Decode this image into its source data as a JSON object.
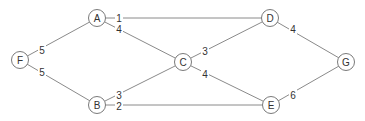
{
  "graph": {
    "nodes": [
      {
        "id": "F",
        "label": "F",
        "x": 20,
        "y": 60
      },
      {
        "id": "A",
        "label": "A",
        "x": 97,
        "y": 18
      },
      {
        "id": "B",
        "label": "B",
        "x": 97,
        "y": 105
      },
      {
        "id": "C",
        "label": "C",
        "x": 183,
        "y": 62
      },
      {
        "id": "D",
        "label": "D",
        "x": 270,
        "y": 18
      },
      {
        "id": "E",
        "label": "E",
        "x": 271,
        "y": 105
      },
      {
        "id": "G",
        "label": "G",
        "x": 346,
        "y": 62
      }
    ],
    "edges": [
      {
        "from": "F",
        "to": "A",
        "weight": "5",
        "lx": 42,
        "ly": 50
      },
      {
        "from": "F",
        "to": "B",
        "weight": "5",
        "lx": 42,
        "ly": 72
      },
      {
        "from": "A",
        "to": "D",
        "weight": "1",
        "lx": 119,
        "ly": 18
      },
      {
        "from": "A",
        "to": "C",
        "weight": "4",
        "lx": 119,
        "ly": 29
      },
      {
        "from": "B",
        "to": "C",
        "weight": "3",
        "lx": 119,
        "ly": 95
      },
      {
        "from": "B",
        "to": "E",
        "weight": "2",
        "lx": 119,
        "ly": 106
      },
      {
        "from": "C",
        "to": "D",
        "weight": "3",
        "lx": 205,
        "ly": 51
      },
      {
        "from": "C",
        "to": "E",
        "weight": "4",
        "lx": 205,
        "ly": 74
      },
      {
        "from": "D",
        "to": "G",
        "weight": "4",
        "lx": 293,
        "ly": 29
      },
      {
        "from": "E",
        "to": "G",
        "weight": "6",
        "lx": 293,
        "ly": 95
      }
    ]
  }
}
